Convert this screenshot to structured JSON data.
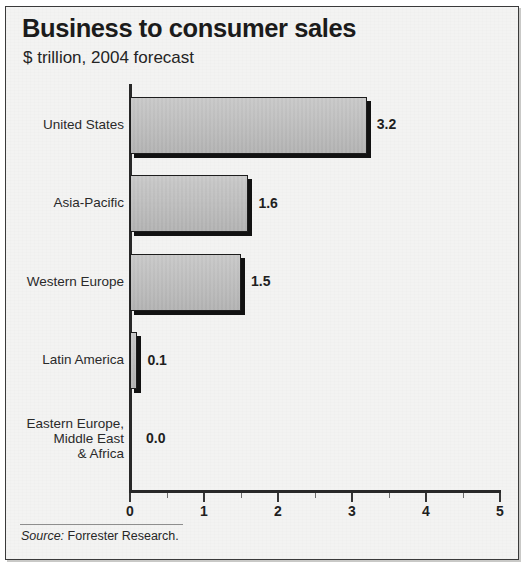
{
  "figure": {
    "title": "Business to consumer sales",
    "subtitle": "$ trillion, 2004 forecast",
    "source_lead": "Source:",
    "source_text": " Forrester Research.",
    "colors": {
      "paper": "#f3f3f2",
      "frame": "#3a3a3a",
      "bar_fill": "#bdbdbd",
      "bar_outline": "#1d1d1d",
      "bar_shadow": "#121212",
      "text": "#1f1f1f"
    }
  },
  "chart_data": {
    "type": "bar",
    "orientation": "horizontal",
    "title": "Business to consumer sales",
    "subtitle": "$ trillion, 2004 forecast",
    "xlabel": "",
    "ylabel": "",
    "xlim": [
      0,
      5
    ],
    "grid": false,
    "legend": false,
    "units": "$ trillion",
    "categories": [
      "United States",
      "Asia-Pacific",
      "Western Europe",
      "Latin America",
      "Eastern Europe,\nMiddle East\n& Africa"
    ],
    "values": [
      3.2,
      1.6,
      1.5,
      0.1,
      0.0
    ],
    "data_labels": [
      "3.2",
      "1.6",
      "1.5",
      "0.1",
      "0.0"
    ],
    "x_ticks_major": [
      0,
      1,
      2,
      3,
      4,
      5
    ],
    "x_tick_labels": [
      "0",
      "1",
      "2",
      "3",
      "4",
      "5"
    ],
    "x_ticks_minor": [
      0.5,
      1.5,
      2.5,
      3.5,
      4.5
    ],
    "source": "Source: Forrester Research."
  }
}
